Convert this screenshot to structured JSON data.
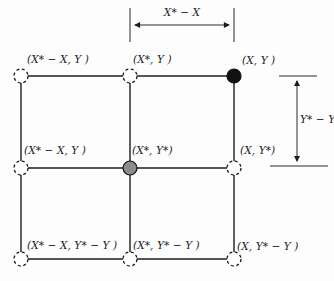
{
  "colors": {
    "line": "#1c1c1c",
    "node_black": "#111111",
    "node_gray": "#8c8c8c",
    "background": "#fdfdfd"
  },
  "dimensions": {
    "horizontal_label": "X* − X",
    "vertical_label": "Y* − Y"
  },
  "nodes": [
    {
      "id": "top-left",
      "label": "(X* − X, Y )",
      "marker": "dashed-open-circle"
    },
    {
      "id": "top-center",
      "label": "(X*, Y )",
      "marker": "dashed-open-circle"
    },
    {
      "id": "top-right",
      "label": "(X, Y )",
      "marker": "filled-black-circle"
    },
    {
      "id": "middle-left",
      "label": "(X* − X, Y )",
      "marker": "dashed-open-circle"
    },
    {
      "id": "middle-center",
      "label": "(X*, Y*)",
      "marker": "filled-gray-circle"
    },
    {
      "id": "middle-right",
      "label": "(X, Y*)",
      "marker": "dashed-open-circle"
    },
    {
      "id": "bottom-left",
      "label": "(X* − X, Y* − Y )",
      "marker": "dashed-open-circle"
    },
    {
      "id": "bottom-center",
      "label": "(X*, Y* − Y )",
      "marker": "dashed-open-circle"
    },
    {
      "id": "bottom-right",
      "label": "(X, Y* − Y )",
      "marker": "dashed-open-circle"
    }
  ]
}
